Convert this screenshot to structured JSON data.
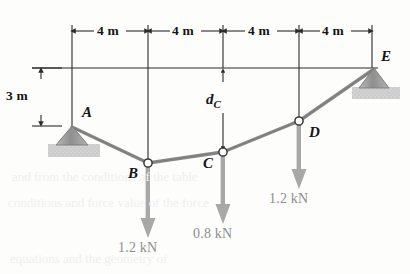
{
  "figure": {
    "colors": {
      "line": "#2b2b2b",
      "cable": "#8a8a8a",
      "load_arrow": "#a8a8a8",
      "support_fill": "#9a9a9a",
      "ground_fill": "#c9c9c9",
      "text": "#141414",
      "load_text": "#8d8d8d",
      "bleed_text": "#efefef"
    }
  },
  "dimensions": {
    "horizontal": [
      {
        "label": "4 m",
        "x": 110,
        "y": 31
      },
      {
        "label": "4 m",
        "x": 185,
        "y": 31
      },
      {
        "label": "4 m",
        "x": 260,
        "y": 31
      },
      {
        "label": "4 m",
        "x": 334,
        "y": 31
      }
    ],
    "vertical": {
      "label": "3 m",
      "x": 13,
      "y": 88
    },
    "unknown": {
      "label": "d",
      "sub": "C",
      "x": 208,
      "y": 96
    }
  },
  "points": [
    {
      "name": "A",
      "label": "A",
      "x": 72,
      "y": 127,
      "label_x": 82,
      "label_y": 112,
      "node": false
    },
    {
      "name": "B",
      "label": "B",
      "x": 148,
      "y": 163,
      "label_x": 129,
      "label_y": 166,
      "node": true
    },
    {
      "name": "C",
      "label": "C",
      "x": 223,
      "y": 152,
      "label_x": 204,
      "label_y": 156,
      "node": true
    },
    {
      "name": "D",
      "label": "D",
      "x": 299,
      "y": 121,
      "label_x": 309,
      "label_y": 126,
      "node": true
    },
    {
      "name": "E",
      "label": "E",
      "x": 374,
      "y": 69,
      "label_x": 381,
      "label_y": 54,
      "node": false
    }
  ],
  "loads": [
    {
      "at": "B",
      "label": "1.2 kN",
      "x": 148,
      "y0": 163,
      "y1": 238,
      "label_x": 119,
      "label_y": 243
    },
    {
      "at": "C",
      "label": "0.8 kN",
      "x": 223,
      "y0": 152,
      "y1": 224,
      "label_x": 194,
      "label_y": 229
    },
    {
      "at": "D",
      "label": "1.2 kN",
      "x": 299,
      "y0": 121,
      "y1": 189,
      "label_x": 270,
      "label_y": 194
    }
  ],
  "gridlines": [
    {
      "x": 72,
      "y0": 25,
      "y1": 127
    },
    {
      "x": 148,
      "y0": 25,
      "y1": 163
    },
    {
      "x": 223,
      "y0": 25,
      "y1": 68
    },
    {
      "x": 299,
      "y0": 25,
      "y1": 121
    },
    {
      "x": 372,
      "y0": 25,
      "y1": 68
    }
  ],
  "datum_line": {
    "x0": 32,
    "x1": 378,
    "y": 68
  },
  "bleed_text": [
    {
      "text": "and from the conditions of the table",
      "x": 12,
      "y": 176
    },
    {
      "text": "conditions and force value of the force",
      "x": 8,
      "y": 202
    },
    {
      "text": "equations and the geometry of",
      "x": 10,
      "y": 258
    }
  ]
}
